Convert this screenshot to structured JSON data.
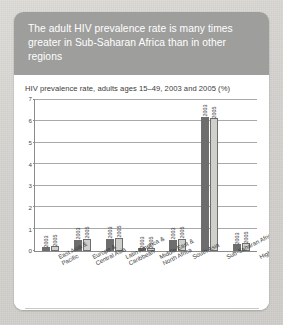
{
  "figure": {
    "title": "The adult HIV prevalence rate is many times greater in Sub-Saharan Africa than in other regions",
    "source": "Source : UNAIDS and WHO",
    "header_color": "#9e9e9c",
    "color_2003": "#6d6d6d",
    "color_2005": "#cfcfcb"
  },
  "chart_data": {
    "type": "bar",
    "title": "HIV prevalence rate, adults ages 15–49, 2003 and 2005 (%)",
    "xlabel": "",
    "ylabel": "",
    "ylim": [
      0,
      7
    ],
    "yticks": [
      0,
      1,
      2,
      3,
      4,
      5,
      6,
      7
    ],
    "ytick_labels": [
      "0",
      "1",
      "2",
      "3",
      "4",
      "5",
      "6",
      "7"
    ],
    "grid": true,
    "legend": "none",
    "bar_labels": [
      "2003",
      "2005"
    ],
    "categories": [
      "East Asia & Pacific",
      "Europe & Central Asia",
      "Latin America & Caribbean",
      "Middle East & North Africa",
      "South Asia",
      "Sub-Saharan Africa",
      "High-income countries"
    ],
    "series": [
      {
        "name": "2003",
        "values": [
          0.15,
          0.5,
          0.55,
          0.1,
          0.5,
          6.2,
          0.3
        ]
      },
      {
        "name": "2005",
        "values": [
          0.2,
          0.55,
          0.6,
          0.1,
          0.55,
          6.15,
          0.35
        ]
      }
    ]
  }
}
